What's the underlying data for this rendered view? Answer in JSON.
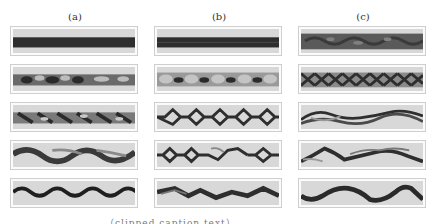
{
  "figure": {
    "columns": [
      {
        "label": "(a)"
      },
      {
        "label": "(b)"
      },
      {
        "label": "(c)"
      }
    ],
    "rows": 5,
    "panels": [
      [
        "solid-band",
        "dotted-vortex-band",
        "diagonal-vortex-band",
        "wavy-band-smeared",
        "sine-wave-band"
      ],
      [
        "solid-band-centerline",
        "vortex-bubble-chain",
        "diamond-chain",
        "diamond-chain-broken",
        "irregular-wave-band"
      ],
      [
        "mottled-band",
        "braided-lattice",
        "braided-strands",
        "tangled-strands",
        "large-wave-band"
      ]
    ],
    "colors": {
      "panel_bg": "#d8d8d8",
      "band_dark": "#2e2e2e",
      "panel_border": "#cfcfcf"
    },
    "caption": "…（clipped caption text）…"
  }
}
